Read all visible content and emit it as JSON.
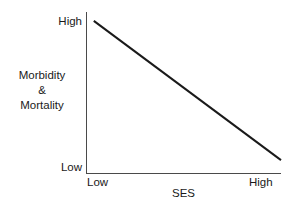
{
  "chart_data": {
    "type": "line",
    "title": "",
    "xlabel": "SES",
    "ylabel": "Morbidity & Mortality",
    "ylabel_lines": [
      "Morbidity",
      "&",
      "Mortality"
    ],
    "grid": false,
    "legend": null,
    "xtick_labels": [
      "Low",
      "High"
    ],
    "ytick_labels": [
      "Low",
      "High"
    ],
    "xlim": [
      "Low",
      "High"
    ],
    "ylim": [
      "Low",
      "High"
    ],
    "series": [
      {
        "name": "Morbidity & Mortality vs SES",
        "color": "#1a1a1a",
        "linewidth": 2,
        "x": [
          0.04,
          1.0
        ],
        "y": [
          0.945,
          0.08
        ],
        "points": [
          {
            "x_label": "Low",
            "y_label": "High"
          },
          {
            "x_label": "High",
            "y_label": "Low"
          }
        ],
        "relationship": "monotonic decreasing"
      }
    ],
    "axis_color": "#4a4a4a",
    "background": "#ffffff"
  },
  "axes": {
    "y_tick_high": "High",
    "y_tick_low": "Low",
    "x_tick_low": "Low",
    "x_tick_high": "High",
    "y_title_line1": "Morbidity",
    "y_title_line2": "&",
    "y_title_line3": "Mortality",
    "x_title": "SES"
  }
}
